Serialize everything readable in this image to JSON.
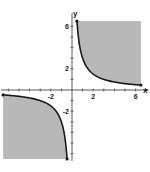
{
  "chart_data": {
    "type": "area",
    "title": "",
    "xlabel": "x",
    "ylabel": "y",
    "xlim": [
      -6.5,
      6.5
    ],
    "ylim": [
      -6.5,
      6.5
    ],
    "grid": false,
    "x_tick_labels": [
      {
        "value": -2,
        "label": "-2"
      },
      {
        "value": 2,
        "label": "2"
      },
      {
        "value": 6,
        "label": "6"
      }
    ],
    "y_tick_labels": [
      {
        "value": 6,
        "label": "6"
      },
      {
        "value": 2,
        "label": "2"
      },
      {
        "value": -2,
        "label": "-2"
      }
    ],
    "minor_ticks": [
      -6,
      -5,
      -4,
      -3,
      -2,
      -1,
      1,
      2,
      3,
      4,
      5,
      6
    ],
    "series": [
      {
        "name": "curve",
        "function": "y = 3/x",
        "k": 3,
        "shading": "xy >= 3",
        "branches": [
          "x>0",
          "x<0"
        ]
      }
    ],
    "colors": {
      "shade": "#b8b8b8",
      "curve": "#1a1a1a",
      "axis": "#333333"
    }
  }
}
